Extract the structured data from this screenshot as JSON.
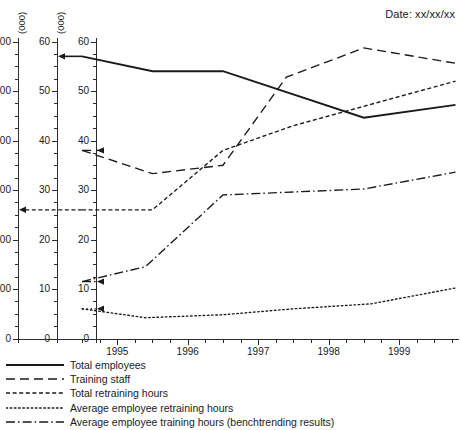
{
  "header": {
    "date_label": "Date: xx/xx/xx"
  },
  "chart_data": {
    "type": "line",
    "title": "",
    "xlabel": "",
    "ylabel": "",
    "grid": false,
    "legend_position": "bottom-left",
    "x_axis": {
      "min": 1994.45,
      "max": 1999.85,
      "tick_labels": [
        "1995",
        "1996",
        "1997",
        "1998",
        "1999"
      ],
      "tick_values": [
        1995,
        1996,
        1997,
        1998,
        1999
      ],
      "minor_tick_step": 0.25
    },
    "y_axes": [
      {
        "id": "axis-1",
        "unit_label": "(000)",
        "tick_labels": [
          "600",
          "500",
          "400",
          "300",
          "200",
          "100",
          "0"
        ],
        "tick_values": [
          600,
          500,
          400,
          300,
          200,
          100,
          0
        ],
        "ylim": [
          0,
          600
        ],
        "minor_tick_step": 25
      },
      {
        "id": "axis-2",
        "unit_label": "(000)",
        "tick_labels": [
          "60",
          "50",
          "40",
          "30",
          "20",
          "10",
          "0"
        ],
        "tick_values": [
          60,
          50,
          40,
          30,
          20,
          10,
          0
        ],
        "ylim": [
          0,
          60
        ],
        "minor_tick_step": 2.5
      },
      {
        "id": "axis-3",
        "unit_label": "",
        "tick_labels": [
          "60",
          "50",
          "40",
          "30",
          "20",
          "10",
          "0"
        ],
        "tick_values": [
          60,
          50,
          40,
          30,
          20,
          10,
          0
        ],
        "ylim": [
          0,
          60
        ],
        "minor_tick_step": 2.5
      }
    ],
    "series": [
      {
        "name": "Total employees",
        "style": "solid",
        "axis": "axis-2",
        "axis_index": 1,
        "arrow_value": 57,
        "x": [
          1994.5,
          1995.5,
          1996.5,
          1998.5,
          1999.8
        ],
        "values": [
          57.0,
          54.0,
          54.0,
          44.6,
          47.2
        ]
      },
      {
        "name": "Training staff",
        "style": "dashed",
        "axis": "axis-3",
        "axis_index": 2,
        "arrow_value": 38,
        "x": [
          1994.5,
          1995.5,
          1996.5,
          1997.4,
          1998.5,
          1999.8
        ],
        "values": [
          38.0,
          33.3,
          35.0,
          52.8,
          58.7,
          55.6
        ]
      },
      {
        "name": "Total retraining hours",
        "style": "dotted-dash",
        "axis": "axis-1",
        "axis_index": 0,
        "arrow_value": 260,
        "x": [
          1994.5,
          1995.5,
          1996.5,
          1997.5,
          1999.8
        ],
        "values": [
          260,
          260,
          380,
          430,
          520
        ]
      },
      {
        "name": "Average employee retraining hours",
        "style": "dotted",
        "axis": "axis-3",
        "axis_index": 2,
        "arrow_value": 6.0,
        "x": [
          1994.5,
          1995.4,
          1996.5,
          1997.5,
          1998.6,
          1999.8
        ],
        "values": [
          6.0,
          4.2,
          4.8,
          6.0,
          7.0,
          10.2
        ]
      },
      {
        "name": "Average employee training hours (benchtrending results)",
        "style": "dash-dot",
        "axis": "axis-3",
        "axis_index": 2,
        "arrow_value": 11.5,
        "x": [
          1994.5,
          1995.4,
          1996.5,
          1998.5,
          1999.8
        ],
        "values": [
          11.5,
          14.5,
          29.0,
          30.2,
          33.6
        ]
      }
    ]
  },
  "legend": {
    "items": [
      {
        "label": "Total employees",
        "style": "solid"
      },
      {
        "label": "Training staff",
        "style": "dashed"
      },
      {
        "label": "Total retraining hours",
        "style": "dotted-dash"
      },
      {
        "label": "Average employee retraining hours",
        "style": "dotted"
      },
      {
        "label": "Average employee training hours (benchtrending results)",
        "style": "dash-dot"
      }
    ]
  }
}
